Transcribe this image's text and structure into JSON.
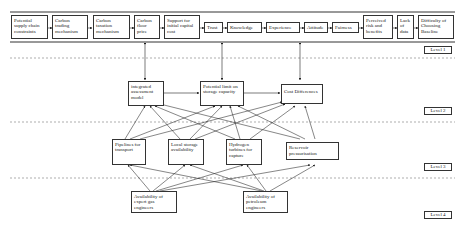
{
  "diagram": {
    "level1_factors": [
      "Potential supply chain constraints",
      "Carbon trading mechanism",
      "Carbon taxation mechanism",
      "Carbon floor price",
      "Support for initial capital cost",
      "Trust",
      "Knowledge",
      "Experience",
      "Attitude",
      "Fairness",
      "Perceived risk and benefits",
      "Lack of data",
      "Difficulty of Choosing Baseline"
    ],
    "level2": [
      "integrated assessment model",
      "Potential limit on storage capacity",
      "Cost Differences"
    ],
    "level3": [
      "Pipelines for transport",
      "Local storage availability",
      "Hydrogen turbines for capture",
      "Reservoir pressurisation"
    ],
    "level4": [
      "Availability of expert gas engineers",
      "Availability of petroleum engineers"
    ],
    "level_labels": [
      "Level 1",
      "Level 2",
      "Level 3",
      "Level 4"
    ],
    "colors": {
      "line": "#333333",
      "dash": "#777777",
      "background": "#ffffff"
    }
  }
}
